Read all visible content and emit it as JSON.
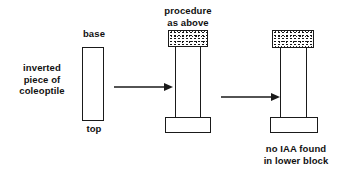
{
  "diagram": {
    "title_text": "",
    "background_color": "#ffffff",
    "line_color": "#1a1a1a",
    "text_color": "#111111",
    "panels": [
      {
        "id": "panel-left",
        "label_side": "inverted\npiece of\ncoleoptile",
        "label_top": "base",
        "label_bottom": "top",
        "shape": "tall-empty-rectangle"
      },
      {
        "id": "panel-middle",
        "label_top": "procedure\nas above",
        "upper_block": "stippled",
        "lower_block": "empty",
        "stems": 2
      },
      {
        "id": "panel-right",
        "label_bottom": "no IAA found\nin lower block",
        "upper_block": "stippled",
        "lower_block": "empty",
        "stems": 2
      }
    ],
    "arrows": [
      {
        "id": "arrow-1",
        "direction": "right"
      },
      {
        "id": "arrow-2",
        "direction": "right"
      }
    ]
  }
}
